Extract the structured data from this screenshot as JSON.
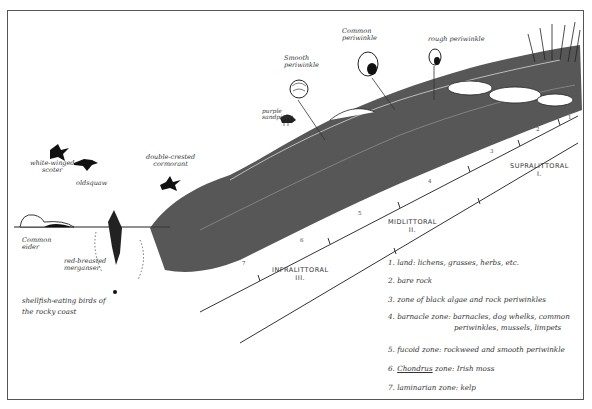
{
  "diagram": {
    "type": "intertidal zonation cross-section (hand-drawn)",
    "caption": "shellfish-eating birds of the rocky coast",
    "birds": [
      {
        "label": "white-winged scoter",
        "lines": [
          "white-winged",
          "scoter"
        ]
      },
      {
        "label": "oldsquaw",
        "lines": [
          "oldsquaw"
        ]
      },
      {
        "label": "double-crested cormorant",
        "lines": [
          "double-crested",
          "cormorant"
        ]
      },
      {
        "label": "common eider",
        "lines": [
          "Common",
          "eider"
        ]
      },
      {
        "label": "red-breasted merganser",
        "lines": [
          "red-breasted",
          "merganser"
        ]
      },
      {
        "label": "purple sandpiper",
        "lines": [
          "purple",
          "sandpiper"
        ]
      }
    ],
    "snails": [
      {
        "label": "smooth periwinkle",
        "lines": [
          "Smooth",
          "periwinkle"
        ]
      },
      {
        "label": "common periwinkle",
        "lines": [
          "Common",
          "periwinkle"
        ]
      },
      {
        "label": "rough periwinkle",
        "lines": [
          "rough periwinkle"
        ]
      }
    ],
    "major_zones": [
      {
        "name": "SUPRALITTORAL",
        "numeral": "I."
      },
      {
        "name": "MIDLITTORAL",
        "numeral": "II."
      },
      {
        "name": "INFRALITTORAL",
        "numeral": "III."
      }
    ],
    "zone_numbers": [
      "1",
      "2",
      "3",
      "4",
      "5",
      "6",
      "7"
    ],
    "legend": [
      {
        "num": "1.",
        "name": "land",
        "desc": "lichens, grasses, herbs, etc."
      },
      {
        "num": "2.",
        "name": "bare rock",
        "desc": ""
      },
      {
        "num": "3.",
        "name": "zone of black algae and rock periwinkles",
        "desc": ""
      },
      {
        "num": "4.",
        "name": "barnacle zone",
        "desc": "barnacles, dog whelks, common",
        "desc2": "periwinkles, mussels, limpets"
      },
      {
        "num": "5.",
        "name": "fucoid zone",
        "desc": "rockweed and smooth periwinkle"
      },
      {
        "num": "6.",
        "name": "Chondrus",
        "name_suffix": " zone",
        "desc": "Irish moss"
      },
      {
        "num": "7.",
        "name": "laminarian zone",
        "desc": "kelp"
      }
    ]
  }
}
